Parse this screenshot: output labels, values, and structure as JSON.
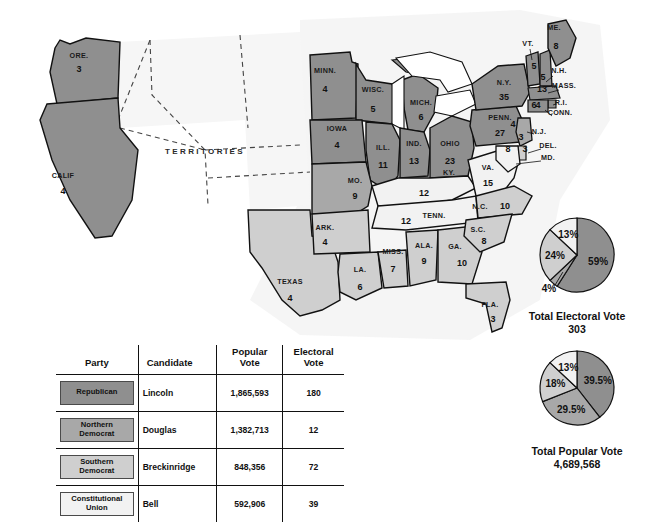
{
  "map": {
    "territories_label": "TERRITORIES",
    "states": [
      {
        "abbr": "ORE.",
        "votes": "3",
        "party": "republican",
        "lx": 79,
        "ly": 58,
        "nx": 79,
        "ny": 72
      },
      {
        "abbr": "CALIF",
        "votes": "4",
        "party": "republican",
        "lx": 63,
        "ly": 178,
        "nx": 63,
        "ny": 194
      },
      {
        "abbr": "MINN.",
        "votes": "4",
        "party": "republican",
        "lx": 325,
        "ly": 73,
        "nx": 325,
        "ny": 92
      },
      {
        "abbr": "WISC.",
        "votes": "5",
        "party": "republican",
        "lx": 373,
        "ly": 92,
        "nx": 373,
        "ny": 112
      },
      {
        "abbr": "IOWA",
        "votes": "4",
        "party": "republican",
        "lx": 337,
        "ly": 131,
        "nx": 337,
        "ny": 148
      },
      {
        "abbr": "MICH.",
        "votes": "6",
        "party": "republican",
        "lx": 421,
        "ly": 105,
        "nx": 421,
        "ny": 120
      },
      {
        "abbr": "ILL.",
        "votes": "11",
        "party": "republican",
        "lx": 383,
        "ly": 150,
        "nx": 383,
        "ny": 168
      },
      {
        "abbr": "IND.",
        "votes": "13",
        "party": "republican",
        "lx": 414,
        "ly": 146,
        "nx": 414,
        "ny": 164
      },
      {
        "abbr": "OHIO",
        "votes": "23",
        "party": "republican",
        "lx": 450,
        "ly": 146,
        "nx": 450,
        "ny": 164
      },
      {
        "abbr": "PENN.",
        "votes": "27",
        "party": "republican",
        "lx": 500,
        "ly": 120,
        "nx": 500,
        "ny": 136
      },
      {
        "abbr": "N.Y.",
        "votes": "35",
        "party": "republican",
        "lx": 504,
        "ly": 85,
        "nx": 504,
        "ny": 100
      },
      {
        "abbr": "VT.",
        "votes": "5",
        "party": "republican",
        "lx": 528,
        "ly": 46,
        "nx": 534,
        "ny": 69
      },
      {
        "abbr": "N.H.",
        "votes": "5",
        "party": "republican",
        "lx": 559,
        "ly": 73,
        "nx": 543,
        "ny": 80
      },
      {
        "abbr": "ME.",
        "votes": "8",
        "party": "republican",
        "lx": 554,
        "ly": 30,
        "nx": 556,
        "ny": 49
      },
      {
        "abbr": "MASS.",
        "votes": "13",
        "party": "republican",
        "lx": 564,
        "ly": 88,
        "nx": 542,
        "ly2": 0,
        "ny": 92
      },
      {
        "abbr": "R.I.",
        "votes": "4",
        "party": "republican",
        "lx": 561,
        "ly": 105,
        "nx": 538,
        "ny": 108
      },
      {
        "abbr": "CONN.",
        "votes": "6",
        "party": "republican",
        "lx": 560,
        "ly": 115,
        "nx": 534,
        "ny": 108
      },
      {
        "abbr": "N.J.",
        "votes": "3",
        "party": "n-democrat",
        "lx": 539,
        "ly": 134,
        "nx": 521,
        "ny": 140
      },
      {
        "abbr": "DEL.",
        "votes": "3",
        "party": "s-democrat",
        "lx": 548,
        "ly": 148,
        "nx": 525,
        "ny": 152
      },
      {
        "abbr": "MD.",
        "votes": "8",
        "party": "c-union",
        "lx": 548,
        "ly": 160,
        "nx": 508,
        "ny": 152
      },
      {
        "abbr": "MO.",
        "votes": "9",
        "party": "n-democrat",
        "lx": 355,
        "ly": 183,
        "nx": 355,
        "ny": 199
      },
      {
        "abbr": "VA.",
        "votes": "15",
        "party": "c-union",
        "lx": 488,
        "ly": 170,
        "nx": 488,
        "ny": 186
      },
      {
        "abbr": "KY.",
        "votes": "12",
        "party": "c-union",
        "lx": 449,
        "ly": 175,
        "nx": 424,
        "ny": 196
      },
      {
        "abbr": "TENN.",
        "votes": "12",
        "party": "c-union",
        "lx": 434,
        "ly": 218,
        "nx": 406,
        "ny": 224
      },
      {
        "abbr": "N.C.",
        "votes": "10",
        "party": "s-democrat",
        "lx": 480,
        "ly": 209,
        "nx": 505,
        "ny": 209
      },
      {
        "abbr": "S.C.",
        "votes": "8",
        "party": "s-democrat",
        "lx": 478,
        "ly": 232,
        "nx": 484,
        "ny": 244
      },
      {
        "abbr": "GA.",
        "votes": "10",
        "party": "s-democrat",
        "lx": 455,
        "ly": 249,
        "nx": 462,
        "ny": 266
      },
      {
        "abbr": "ALA.",
        "votes": "9",
        "party": "s-democrat",
        "lx": 424,
        "ly": 248,
        "nx": 424,
        "ny": 264
      },
      {
        "abbr": "MISS.",
        "votes": "7",
        "party": "s-democrat",
        "lx": 393,
        "ly": 254,
        "nx": 393,
        "ny": 272
      },
      {
        "abbr": "ARK.",
        "votes": "4",
        "party": "s-democrat",
        "lx": 325,
        "ly": 230,
        "nx": 325,
        "ny": 245
      },
      {
        "abbr": "LA.",
        "votes": "6",
        "party": "s-democrat",
        "lx": 360,
        "ly": 272,
        "nx": 360,
        "ny": 290
      },
      {
        "abbr": "TEXAS",
        "votes": "4",
        "party": "s-democrat",
        "lx": 290,
        "ly": 284,
        "nx": 290,
        "ny": 301
      },
      {
        "abbr": "FLA.",
        "votes": "3",
        "party": "s-democrat",
        "lx": 490,
        "ly": 307,
        "nx": 493,
        "ny": 322
      },
      {
        "abbr": "N.J.",
        "votes": "4",
        "party": "republican",
        "lx": -99,
        "ly": -99,
        "nx": 513,
        "ny": 127
      }
    ]
  },
  "pies": {
    "electoral": {
      "caption": "Total Electoral Vote",
      "total": "303",
      "slices": [
        {
          "label": "59%",
          "value": 59,
          "party": "republican"
        },
        {
          "label": "4%",
          "value": 4,
          "party": "n-democrat"
        },
        {
          "label": "24%",
          "value": 24,
          "party": "s-democrat"
        },
        {
          "label": "13%",
          "value": 13,
          "party": "c-union"
        }
      ]
    },
    "popular": {
      "caption": "Total Popular Vote",
      "total": "4,689,568",
      "slices": [
        {
          "label": "39.5%",
          "value": 39.5,
          "party": "republican"
        },
        {
          "label": "29.5%",
          "value": 29.5,
          "party": "n-democrat"
        },
        {
          "label": "18%",
          "value": 18,
          "party": "s-democrat"
        },
        {
          "label": "13%",
          "value": 13,
          "party": "c-union"
        }
      ]
    }
  },
  "table": {
    "headers": {
      "party": "Party",
      "candidate": "Candidate",
      "popular": "Popular\nVote",
      "popular_l1": "Popular",
      "popular_l2": "Vote",
      "electoral_l1": "Electoral",
      "electoral_l2": "Vote"
    },
    "rows": [
      {
        "party": "Republican",
        "party_l1": "Republican",
        "party_l2": "",
        "candidate": "Lincoln",
        "popular": "1,865,593",
        "electoral": "180",
        "key": "republican"
      },
      {
        "party": "Northern Democrat",
        "party_l1": "Northern",
        "party_l2": "Democrat",
        "candidate": "Douglas",
        "popular": "1,382,713",
        "electoral": "12",
        "key": "n-democrat"
      },
      {
        "party": "Southern Democrat",
        "party_l1": "Southern",
        "party_l2": "Democrat",
        "candidate": "Breckinridge",
        "popular": "848,356",
        "electoral": "72",
        "key": "s-democrat"
      },
      {
        "party": "Constitutional Union",
        "party_l1": "Constitutional",
        "party_l2": "Union",
        "candidate": "Bell",
        "popular": "592,906",
        "electoral": "39",
        "key": "c-union"
      }
    ]
  },
  "colors": {
    "republican": "#8f8f8f",
    "n_democrat": "#a8a8a8",
    "s_democrat": "#cfcfcf",
    "c_union": "#f2f2f2",
    "outline": "#111111",
    "paper": "#ffffff",
    "sea": "#ededed"
  },
  "chart_data": [
    {
      "type": "pie",
      "title": "Total Electoral Vote",
      "total": 303,
      "labels": [
        "Republican (Lincoln)",
        "Northern Democrat (Douglas)",
        "Southern Democrat (Breckinridge)",
        "Constitutional Union (Bell)"
      ],
      "values": [
        59,
        4,
        24,
        13
      ],
      "value_labels": [
        "59%",
        "4%",
        "24%",
        "13%"
      ],
      "counts": [
        180,
        12,
        72,
        39
      ],
      "legend": "table swatches"
    },
    {
      "type": "pie",
      "title": "Total Popular Vote",
      "total": 4689568,
      "labels": [
        "Republican (Lincoln)",
        "Northern Democrat (Douglas)",
        "Southern Democrat (Breckinridge)",
        "Constitutional Union (Bell)"
      ],
      "values": [
        39.5,
        29.5,
        18,
        13
      ],
      "value_labels": [
        "39.5%",
        "29.5%",
        "18%",
        "13%"
      ],
      "counts": [
        1865593,
        1382713,
        848356,
        592906
      ],
      "legend": "table swatches"
    },
    {
      "type": "table",
      "title": "1860 Presidential Election Results",
      "columns": [
        "Party",
        "Candidate",
        "Popular Vote",
        "Electoral Vote"
      ],
      "rows": [
        [
          "Republican",
          "Lincoln",
          "1,865,593",
          "180"
        ],
        [
          "Northern Democrat",
          "Douglas",
          "1,382,713",
          "12"
        ],
        [
          "Southern Democrat",
          "Breckinridge",
          "848,356",
          "72"
        ],
        [
          "Constitutional Union",
          "Bell",
          "592,906",
          "39"
        ]
      ]
    }
  ]
}
